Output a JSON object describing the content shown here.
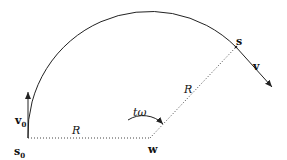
{
  "diagram": {
    "labels": {
      "s0": "s",
      "s0_sub": "0",
      "v0": "v",
      "v0_sub": "0",
      "R_bottom": "R",
      "R_diag": "R",
      "angle": "tω",
      "w": "w",
      "s": "s",
      "v": "v"
    },
    "colors": {
      "stroke": "#222222",
      "background": "#ffffff"
    }
  }
}
